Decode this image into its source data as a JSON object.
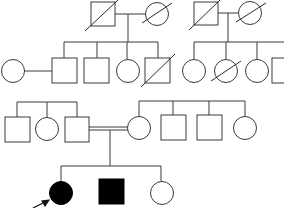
{
  "diagram": {
    "type": "pedigree",
    "colors": {
      "stroke": "#3a3a3a",
      "affected_fill": "#000000",
      "unaffected_fill": "#ffffff"
    },
    "generations": [
      {
        "id": "I",
        "individuals": [
          {
            "id": "I-1",
            "sex": "male",
            "deceased": true,
            "affected": false
          },
          {
            "id": "I-2",
            "sex": "female",
            "deceased": true,
            "affected": false
          },
          {
            "id": "I-3",
            "sex": "male",
            "deceased": true,
            "affected": false
          },
          {
            "id": "I-4",
            "sex": "female",
            "deceased": true,
            "affected": false
          }
        ]
      },
      {
        "id": "II",
        "individuals": [
          {
            "id": "II-1",
            "sex": "female",
            "deceased": false,
            "affected": false,
            "note": "spouse of II-2"
          },
          {
            "id": "II-2",
            "sex": "male",
            "deceased": false,
            "affected": false
          },
          {
            "id": "II-3",
            "sex": "male",
            "deceased": false,
            "affected": false
          },
          {
            "id": "II-4",
            "sex": "female",
            "deceased": false,
            "affected": false
          },
          {
            "id": "II-5",
            "sex": "male",
            "deceased": true,
            "affected": false
          },
          {
            "id": "II-6",
            "sex": "female",
            "deceased": false,
            "affected": false
          },
          {
            "id": "II-7",
            "sex": "female",
            "deceased": true,
            "affected": false
          },
          {
            "id": "II-8",
            "sex": "female",
            "deceased": false,
            "affected": false
          },
          {
            "id": "II-9",
            "sex": "male",
            "deceased": false,
            "affected": false
          }
        ]
      },
      {
        "id": "III",
        "individuals": [
          {
            "id": "III-1",
            "sex": "male",
            "deceased": false,
            "affected": false
          },
          {
            "id": "III-2",
            "sex": "female",
            "deceased": false,
            "affected": false
          },
          {
            "id": "III-3",
            "sex": "male",
            "deceased": false,
            "affected": false
          },
          {
            "id": "III-4",
            "sex": "female",
            "deceased": false,
            "affected": false
          },
          {
            "id": "III-5",
            "sex": "male",
            "deceased": false,
            "affected": false
          },
          {
            "id": "III-6",
            "sex": "male",
            "deceased": false,
            "affected": false
          },
          {
            "id": "III-7",
            "sex": "female",
            "deceased": false,
            "affected": false
          }
        ],
        "consanguineous_union": [
          "III-3",
          "III-4"
        ]
      },
      {
        "id": "IV",
        "individuals": [
          {
            "id": "IV-1",
            "sex": "female",
            "deceased": false,
            "affected": true,
            "proband": true
          },
          {
            "id": "IV-2",
            "sex": "male",
            "deceased": false,
            "affected": true
          },
          {
            "id": "IV-3",
            "sex": "female",
            "deceased": false,
            "affected": false
          }
        ]
      }
    ],
    "legend": {
      "square": "male",
      "circle": "female",
      "filled": "affected",
      "slash": "deceased",
      "double_line": "consanguineous marriage",
      "arrow": "proband"
    }
  }
}
